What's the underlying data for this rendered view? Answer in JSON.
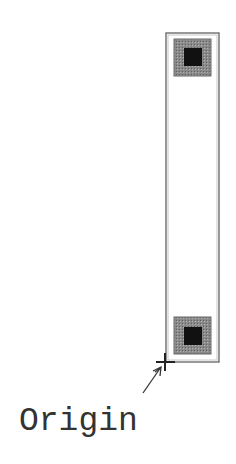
{
  "diagram": {
    "title": "",
    "label": "Origin",
    "colors": {
      "background": "#ffffff",
      "outline": "#666666",
      "pad_outer": "#808080",
      "pad_inner": "#111111",
      "marker": "#222222",
      "arrow": "#333333",
      "text": "#333333"
    },
    "body_rect": {
      "x": 166,
      "y": 33,
      "width": 53,
      "height": 329
    },
    "pads": [
      {
        "name": "top-pad",
        "outer": {
          "x": 174,
          "y": 39,
          "size": 37
        },
        "inner": {
          "x": 184,
          "y": 48,
          "size": 18
        }
      },
      {
        "name": "bottom-pad",
        "outer": {
          "x": 174,
          "y": 317,
          "size": 37
        },
        "inner": {
          "x": 184,
          "y": 327,
          "size": 18
        }
      }
    ],
    "origin_marker": {
      "x": 165,
      "y": 362,
      "arm": 9
    },
    "arrow": {
      "from": {
        "x": 143,
        "y": 393
      },
      "to": {
        "x": 161,
        "y": 367
      }
    }
  }
}
